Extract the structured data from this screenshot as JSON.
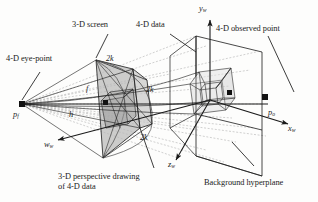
{
  "figure": {
    "type": "technical-line-diagram",
    "background_color": "#fdfdfc",
    "ink_color": "#1a1a1a",
    "dashed_ray_color": "#9a9a9a",
    "screen_fill_color": "#b9b9b9",
    "wireframe_fill_color": "#d9d9d9"
  },
  "labels": {
    "eye_point": "4-D eye-point",
    "screen": "3-D screen",
    "data": "4-D data",
    "observed_point": "4-D observed point",
    "background_hyperplane": "Background hyperplane",
    "perspective_drawing_line1": "3-D perspective drawing",
    "perspective_drawing_line2": "of 4-D data"
  },
  "symbols": {
    "eye_point_symbol": "p",
    "eye_point_sub": "f",
    "observed_point_symbol": "p",
    "observed_point_sub": "o",
    "focal_distance": "f",
    "hyperplane_distance": "h",
    "half_extent_1": "2k",
    "half_extent_2": "2k",
    "half_extent_3": "2k"
  },
  "axes": [
    {
      "name": "y-axis",
      "symbol": "y",
      "sub": "w",
      "direction": "up"
    },
    {
      "name": "x-axis",
      "symbol": "x",
      "sub": "w",
      "direction": "right-down"
    },
    {
      "name": "z-axis",
      "symbol": "z",
      "sub": "w",
      "direction": "down-left"
    },
    {
      "name": "w-axis",
      "symbol": "w",
      "sub": "w",
      "direction": "down-left"
    }
  ],
  "leader_lines": [
    {
      "name": "leader-to-screen",
      "from_label": "3-D screen"
    },
    {
      "name": "leader-to-data",
      "from_label": "4-D data"
    },
    {
      "name": "leader-to-observed-point",
      "from_label": "4-D observed point"
    },
    {
      "name": "leader-to-hyperplane",
      "from_label": "Background hyperplane"
    },
    {
      "name": "leader-to-drawing",
      "from_label": "3-D perspective drawing of 4-D data"
    },
    {
      "name": "leader-to-eye-point",
      "from_label": "4-D eye-point"
    }
  ]
}
